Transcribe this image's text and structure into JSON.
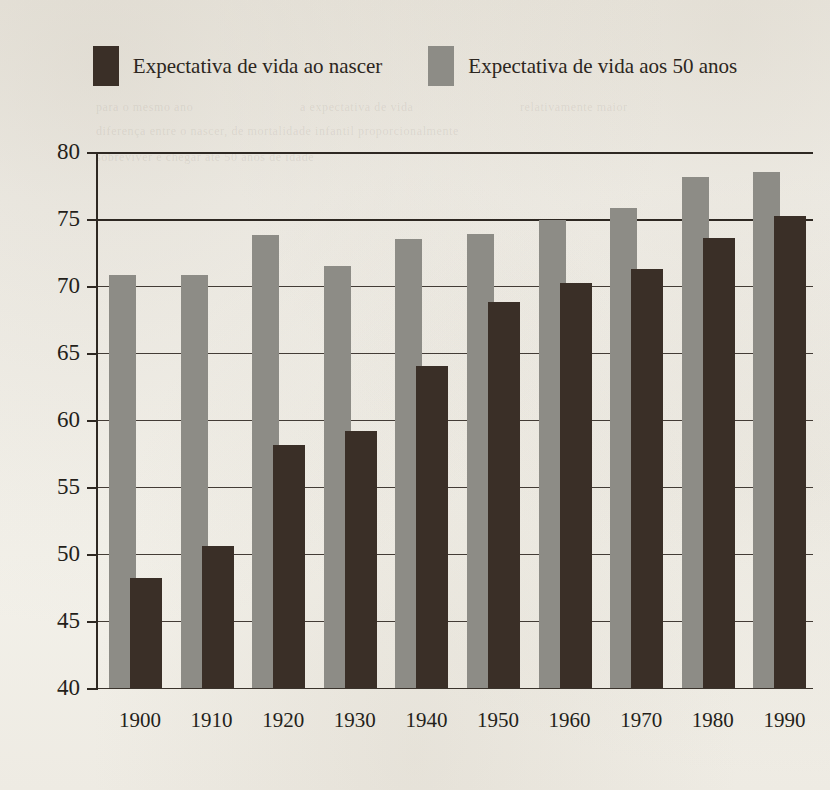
{
  "legend": {
    "items": [
      {
        "label": "Expectativa de vida ao nascer",
        "color": "#3a2f27",
        "key": "at_birth"
      },
      {
        "label": "Expectativa de vida aos 50 anos",
        "color": "#8d8c86",
        "key": "at_50"
      }
    ]
  },
  "colors": {
    "at_birth": "#3a2f27",
    "at_50": "#8d8c86",
    "axis": "#2e2822",
    "text": "#241f1a",
    "paper": "#f4f2ec"
  },
  "chart_data": {
    "type": "bar",
    "title": "",
    "xlabel": "",
    "ylabel": "",
    "grid": true,
    "legend_position": "top",
    "categories": [
      "1900",
      "1910",
      "1920",
      "1930",
      "1940",
      "1950",
      "1960",
      "1970",
      "1980",
      "1990"
    ],
    "ylim": [
      40,
      80
    ],
    "yticks": [
      40,
      45,
      50,
      55,
      60,
      65,
      70,
      75,
      80
    ],
    "ytick_labels": [
      "40",
      "45",
      "50",
      "55",
      "60",
      "65",
      "70",
      "75",
      "80"
    ],
    "series": [
      {
        "name": "Expectativa de vida aos 50 anos",
        "key": "at_50",
        "color": "#8d8c86",
        "values": [
          70.8,
          70.8,
          73.8,
          71.5,
          73.5,
          73.9,
          74.9,
          75.8,
          78.1,
          78.5
        ]
      },
      {
        "name": "Expectativa de vida ao nascer",
        "key": "at_birth",
        "color": "#3a2f27",
        "values": [
          48.2,
          50.6,
          58.1,
          59.2,
          64.0,
          68.8,
          70.2,
          71.3,
          73.6,
          75.2
        ]
      }
    ]
  },
  "ghost_text": [
    {
      "text": "para o mesmo ano",
      "x": 96,
      "y": 100
    },
    {
      "text": "a expectativa de vida",
      "x": 300,
      "y": 100
    },
    {
      "text": "relativamente maior",
      "x": 520,
      "y": 100
    },
    {
      "text": "diferença entre o nascer, de mortalidade infantil proporcionalmente",
      "x": 96,
      "y": 124
    },
    {
      "text": "sobreviver e chegar até 50 anos de idade",
      "x": 96,
      "y": 150
    }
  ]
}
